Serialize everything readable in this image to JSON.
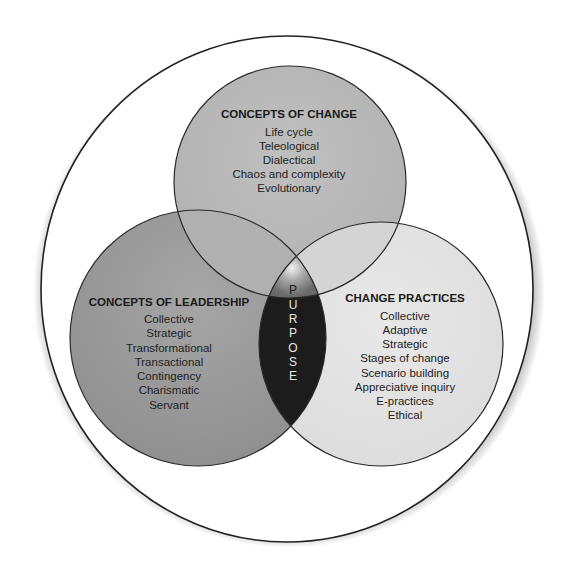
{
  "diagram": {
    "type": "venn",
    "colors": {
      "outer_fill": "#ffffff",
      "outer_stroke": "#222222",
      "top_circle": "#b9b9b9",
      "left_circle": "#9c9c9c",
      "right_circle": "#e3e3e3",
      "center_dark": "#1c1c1c"
    },
    "circles": [
      {
        "id": "concepts-of-change",
        "title": "CONCEPTS OF CHANGE",
        "items": [
          "Life cycle",
          "Teleological",
          "Dialectical",
          "Chaos and complexity",
          "Evolutionary"
        ]
      },
      {
        "id": "concepts-of-leadership",
        "title": "CONCEPTS OF LEADERSHIP",
        "items": [
          "Collective",
          "Strategic",
          "Transformational",
          "Transactional",
          "Contingency",
          "Charismatic",
          "Servant"
        ]
      },
      {
        "id": "change-practices",
        "title": "CHANGE PRACTICES",
        "items": [
          "Collective",
          "Adaptive",
          "Strategic",
          "Stages of change",
          "Scenario building",
          "Appreciative inquiry",
          "E-practices",
          "Ethical"
        ]
      }
    ],
    "center": {
      "label": "PURPOSE",
      "letters": [
        "P",
        "U",
        "R",
        "P",
        "O",
        "S",
        "E"
      ]
    }
  }
}
